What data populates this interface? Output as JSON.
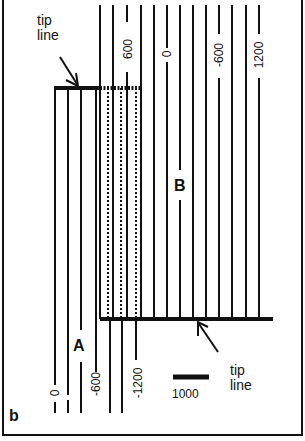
{
  "panel_label": "b",
  "region_labels": {
    "a": "A",
    "b": "B"
  },
  "tip_line_labels": {
    "upper": [
      "tip",
      "line"
    ],
    "lower": [
      "tip",
      "line"
    ]
  },
  "scale_bar": {
    "label": "1000"
  },
  "contour_labels_B": [
    "600",
    "0",
    "-600",
    "1200"
  ],
  "contour_labels_A": [
    "0",
    "-600",
    "-1200"
  ],
  "colors": {
    "ink": "#111111",
    "background": "#ffffff"
  }
}
